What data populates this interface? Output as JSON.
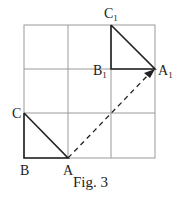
{
  "figure": {
    "caption": "Fig. 3",
    "grid": {
      "rows": 3,
      "cols": 3,
      "color": "#9a9a9a"
    },
    "line_color": "#222222",
    "points": {
      "A": {
        "label": "A",
        "sub": ""
      },
      "B": {
        "label": "B",
        "sub": ""
      },
      "C": {
        "label": "C",
        "sub": ""
      },
      "A1": {
        "label": "A",
        "sub": "1"
      },
      "B1": {
        "label": "B",
        "sub": "1"
      },
      "C1": {
        "label": "C",
        "sub": "1"
      }
    },
    "triangles": [
      "ABC",
      "A1B1C1"
    ],
    "vector": {
      "from": "A",
      "to": "A1",
      "style": "dashed"
    }
  }
}
